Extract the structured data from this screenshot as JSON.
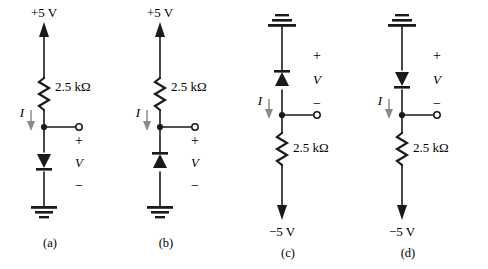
{
  "figure": {
    "background_color": "#ffffff",
    "line_color": "#1a1a1a"
  },
  "labels": {
    "supply_positive": "+5 V",
    "supply_negative": "−5 V",
    "resistance": "2.5 kΩ",
    "current": "I",
    "voltage": "V",
    "plus": "+",
    "minus": "−"
  },
  "circuits": [
    {
      "id": "a",
      "caption": "(a)",
      "supply_label": "+5 V",
      "supply_position": "top",
      "ground_position": "bottom",
      "resistor_label": "2.5 kΩ",
      "resistor_position": "top",
      "diode_direction": "down",
      "current_label": "I",
      "voltage_label": "V",
      "terminal_polarity_top": "+",
      "terminal_polarity_bottom": "−"
    },
    {
      "id": "b",
      "caption": "(b)",
      "supply_label": "+5 V",
      "supply_position": "top",
      "ground_position": "bottom",
      "resistor_label": "2.5 kΩ",
      "resistor_position": "top",
      "diode_direction": "up",
      "current_label": "I",
      "voltage_label": "V",
      "terminal_polarity_top": "+",
      "terminal_polarity_bottom": "−"
    },
    {
      "id": "c",
      "caption": "(c)",
      "supply_label": "−5 V",
      "supply_position": "bottom",
      "ground_position": "top",
      "resistor_label": "2.5 kΩ",
      "resistor_position": "bottom",
      "diode_direction": "up",
      "current_label": "I",
      "voltage_label": "V",
      "terminal_polarity_top": "+",
      "terminal_polarity_bottom": "−"
    },
    {
      "id": "d",
      "caption": "(d)",
      "supply_label": "−5 V",
      "supply_position": "bottom",
      "ground_position": "top",
      "resistor_label": "2.5 kΩ",
      "resistor_position": "bottom",
      "diode_direction": "down",
      "current_label": "I",
      "voltage_label": "V",
      "terminal_polarity_top": "+",
      "terminal_polarity_bottom": "−"
    }
  ]
}
